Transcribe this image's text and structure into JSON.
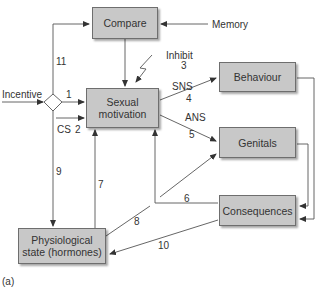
{
  "nodes": {
    "compare": "Compare",
    "sexual_motivation_line1": "Sexual",
    "sexual_motivation_line2": "motivation",
    "behaviour": "Behaviour",
    "genitals": "Genitals",
    "consequences": "Consequences",
    "physiological_line1": "Physiological",
    "physiological_line2": "state (hormones)"
  },
  "inputs": {
    "memory": "Memory",
    "incentive": "Incentive",
    "inhibit": "Inhibit",
    "cs": "CS"
  },
  "pathway_labels": {
    "sns": "SNS",
    "ans": "ANS"
  },
  "edges": {
    "e1": "1",
    "e2": "2",
    "e3": "3",
    "e4": "4",
    "e5": "5",
    "e6": "6",
    "e7": "7",
    "e8": "8",
    "e9": "9",
    "e10": "10",
    "e11": "11"
  },
  "caption": "(a)",
  "colors": {
    "box_fill": "#c8c8c8",
    "box_border": "#6e6e6e",
    "line": "#555555"
  }
}
